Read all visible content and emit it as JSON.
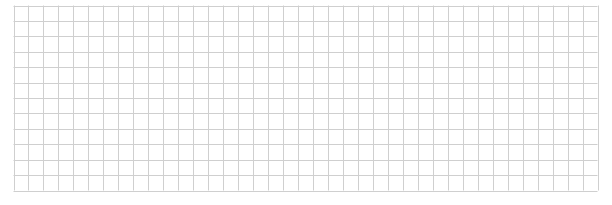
{
  "grid": {
    "columns": 39,
    "rows": 12,
    "line_color": "#cfcfcf",
    "background": "#ffffff"
  }
}
